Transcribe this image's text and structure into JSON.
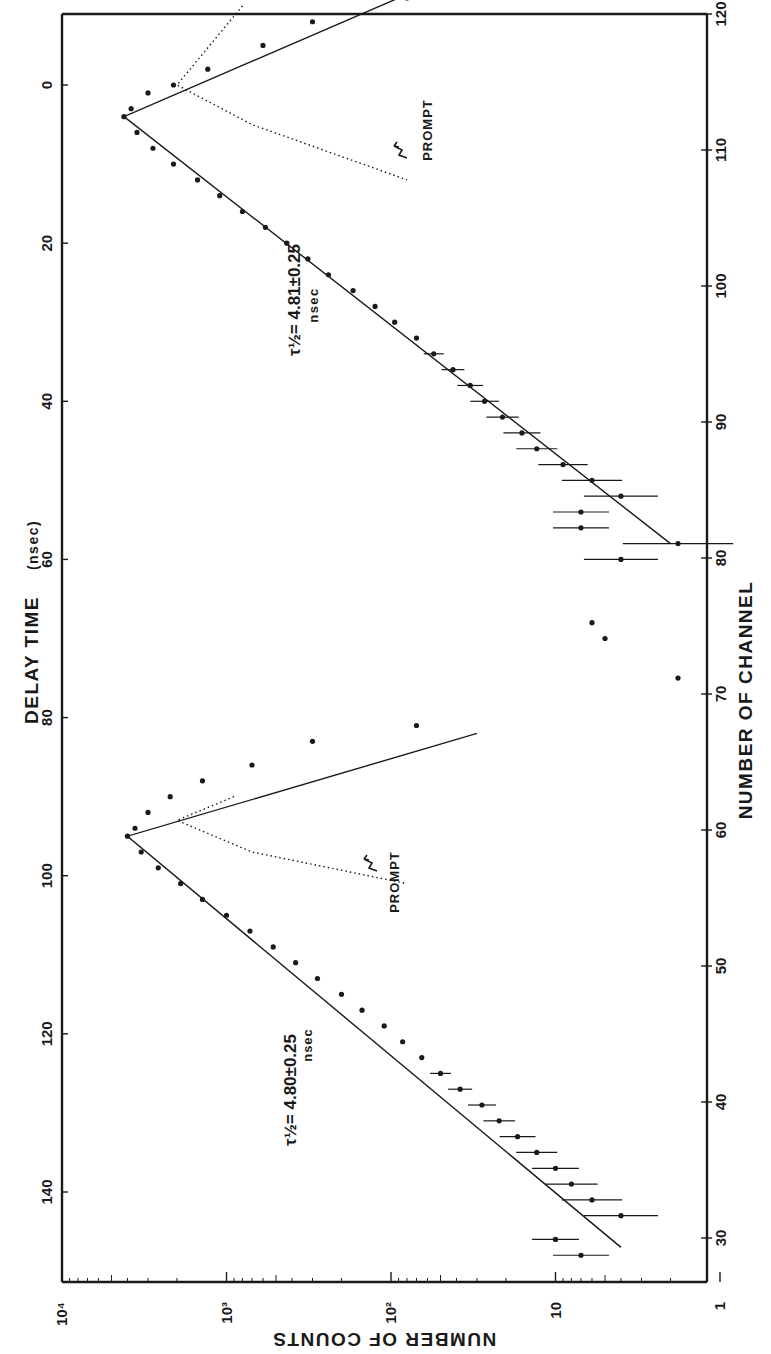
{
  "chart_data": {
    "type": "scatter",
    "title": "",
    "orientation": "rotated 90 degrees clockwise (counts increase toward left)",
    "axes": {
      "delay_time": {
        "label": "DELAY TIME",
        "unit": "(nsec)",
        "position": "left (rotated)",
        "ticks": [
          0,
          20,
          40,
          60,
          80,
          100,
          120,
          140
        ],
        "range": [
          -8,
          152
        ]
      },
      "counts": {
        "label": "NUMBER OF COUNTS",
        "position": "bottom (rotated, reversed)",
        "scale": "log",
        "tick_labels": [
          "10⁴",
          "10³",
          "10²",
          "10",
          "1"
        ],
        "tick_values": [
          10000,
          1000,
          100,
          10,
          1
        ],
        "range": [
          1,
          10000
        ]
      },
      "channel": {
        "label": "NUMBER OF CHANNEL",
        "position": "right (rotated)",
        "ticks": [
          120,
          110,
          100,
          90,
          80,
          70,
          60,
          50,
          40,
          30
        ],
        "range": [
          25,
          120
        ]
      }
    },
    "annotations": [
      {
        "text_main": "τ½ = 4.81±0.25",
        "text_unit": "nsec",
        "near_delay_ns": 25,
        "near_counts": 400
      },
      {
        "text_main": "τ½ = 4.80±0.25",
        "text_unit": "nsec",
        "near_delay_ns": 128,
        "near_counts": 400
      },
      {
        "text": "PROMPT",
        "near_delay_ns": 8,
        "near_counts": 60
      },
      {
        "text": "PROMPT",
        "near_delay_ns": 95,
        "near_counts": 60
      }
    ],
    "series": [
      {
        "name": "Peak 1 data (delayed coincidence)",
        "points_delay_counts": [
          [
            -11,
            80
          ],
          [
            -8,
            300
          ],
          [
            -5,
            600
          ],
          [
            -2,
            1300
          ],
          [
            0,
            2100
          ],
          [
            1,
            3000
          ],
          [
            3,
            3800
          ],
          [
            4,
            4200
          ],
          [
            6,
            3500
          ],
          [
            8,
            2800
          ],
          [
            10,
            2100
          ],
          [
            12,
            1500
          ],
          [
            14,
            1100
          ],
          [
            16,
            800
          ],
          [
            18,
            580
          ],
          [
            20,
            430
          ],
          [
            22,
            320
          ],
          [
            24,
            240
          ],
          [
            26,
            170
          ],
          [
            28,
            125
          ],
          [
            30,
            95
          ],
          [
            32,
            70
          ],
          [
            34,
            55
          ],
          [
            36,
            42
          ],
          [
            38,
            33
          ],
          [
            40,
            27
          ],
          [
            42,
            21
          ],
          [
            44,
            16
          ],
          [
            46,
            13
          ],
          [
            48,
            9
          ],
          [
            50,
            6
          ],
          [
            52,
            4
          ],
          [
            54,
            7
          ],
          [
            56,
            7
          ],
          [
            58,
            1.8
          ],
          [
            60,
            4
          ]
        ],
        "error_bars_on_tail": true
      },
      {
        "name": "Peak 1 fit",
        "half_life_ns": 4.81,
        "half_life_err_ns": 0.25,
        "line": [
          [
            -11,
            90
          ],
          [
            4,
            4200
          ],
          [
            58,
            2
          ]
        ]
      },
      {
        "name": "Peak 1 prompt (dotted)",
        "line": [
          [
            -10,
            800
          ],
          [
            0,
            2000
          ],
          [
            5,
            700
          ],
          [
            12,
            80
          ]
        ]
      },
      {
        "name": "Peak 2 data (delayed coincidence)",
        "points_delay_counts": [
          [
            81,
            70
          ],
          [
            83,
            300
          ],
          [
            86,
            700
          ],
          [
            88,
            1400
          ],
          [
            90,
            2200
          ],
          [
            92,
            3000
          ],
          [
            94,
            3600
          ],
          [
            95,
            4000
          ],
          [
            97,
            3300
          ],
          [
            99,
            2600
          ],
          [
            101,
            1900
          ],
          [
            103,
            1400
          ],
          [
            105,
            1000
          ],
          [
            107,
            720
          ],
          [
            109,
            520
          ],
          [
            111,
            380
          ],
          [
            113,
            280
          ],
          [
            115,
            200
          ],
          [
            117,
            150
          ],
          [
            119,
            110
          ],
          [
            121,
            85
          ],
          [
            123,
            65
          ],
          [
            125,
            50
          ],
          [
            127,
            38
          ],
          [
            129,
            28
          ],
          [
            131,
            22
          ],
          [
            133,
            17
          ],
          [
            135,
            13
          ],
          [
            137,
            10
          ],
          [
            139,
            8
          ],
          [
            141,
            6
          ],
          [
            143,
            4
          ],
          [
            146,
            10
          ],
          [
            148,
            7
          ]
        ],
        "error_bars_on_tail": true
      },
      {
        "name": "Peak 2 fit",
        "half_life_ns": 4.8,
        "half_life_err_ns": 0.25,
        "line": [
          [
            82,
            30
          ],
          [
            95,
            4000
          ],
          [
            147,
            4
          ]
        ]
      },
      {
        "name": "Peak 2 prompt (dotted)",
        "line": [
          [
            90,
            900
          ],
          [
            93,
            2000
          ],
          [
            97,
            700
          ],
          [
            101,
            80
          ]
        ]
      },
      {
        "name": "Background points",
        "points_delay_counts": [
          [
            68,
            6
          ],
          [
            70,
            5
          ],
          [
            75,
            1.8
          ]
        ]
      }
    ]
  },
  "labels": {
    "delay_axis_title": "DELAY TIME",
    "delay_axis_unit": "(nsec)",
    "counts_axis_title": "NUMBER OF COUNTS",
    "channel_axis_title": "NUMBER OF CHANNEL",
    "prompt_1": "PROMPT",
    "prompt_2": "PROMPT",
    "tau1_main": "τ½= 4.81±0.25",
    "tau1_unit": "nsec",
    "tau2_main": "τ½= 4.80±0.25",
    "tau2_unit": "nsec",
    "delay_ticks": [
      "0",
      "20",
      "40",
      "60",
      "80",
      "100",
      "120",
      "140"
    ],
    "channel_ticks": [
      "120",
      "110",
      "100",
      "90",
      "80",
      "70",
      "60",
      "50",
      "40",
      "30"
    ],
    "count_ticks": [
      "10⁴",
      "10³",
      "10²",
      "10",
      "1"
    ]
  },
  "colors": {
    "ink": "#1a1a1a",
    "paper": "#ffffff"
  }
}
